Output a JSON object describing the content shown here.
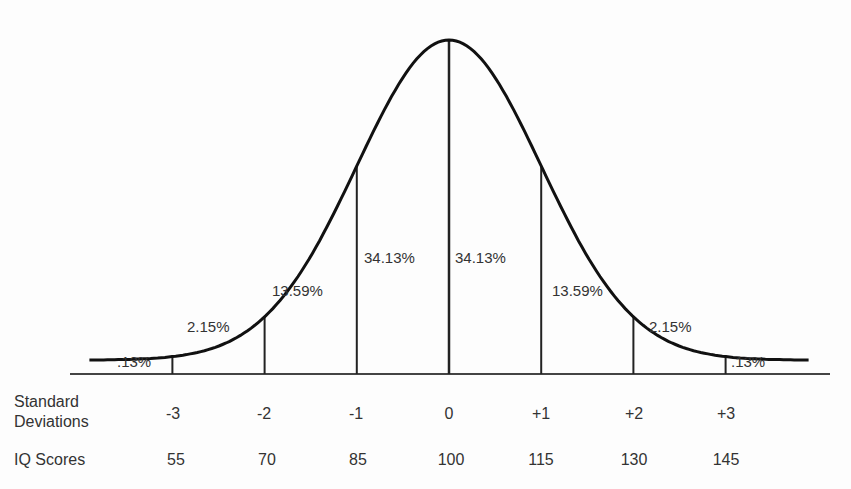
{
  "chart_data": {
    "type": "area",
    "title": "",
    "subtitle": "Normal distribution of IQ scores",
    "xlabel": "",
    "ylabel": "",
    "grid": false,
    "legend": null,
    "distribution": {
      "mean": 100,
      "sd": 15,
      "x_range_sd": [
        -3.9,
        3.9
      ]
    },
    "row_labels": {
      "sd_line1": "Standard",
      "sd_line2": "Deviations",
      "iq": "IQ Scores"
    },
    "sd_ticks": [
      "-3",
      "-2",
      "-1",
      "0",
      "+1",
      "+2",
      "+3"
    ],
    "iq_ticks": [
      "55",
      "70",
      "85",
      "100",
      "115",
      "130",
      "145"
    ],
    "sd_positions": [
      -3,
      -2,
      -1,
      0,
      1,
      2,
      3
    ],
    "segments": [
      {
        "range": "< -3 SD",
        "label": ".13%",
        "value": 0.13
      },
      {
        "range": "-3 to -2 SD",
        "label": "2.15%",
        "value": 2.15
      },
      {
        "range": "-2 to -1 SD",
        "label": "13.59%",
        "value": 13.59
      },
      {
        "range": "-1 to 0 SD",
        "label": "34.13%",
        "value": 34.13
      },
      {
        "range": "0 to +1 SD",
        "label": "34.13%",
        "value": 34.13
      },
      {
        "range": "+1 to +2 SD",
        "label": "13.59%",
        "value": 13.59
      },
      {
        "range": "+2 to +3 SD",
        "label": "2.15%",
        "value": 2.15
      },
      {
        "range": "> +3 SD",
        "label": ".13%",
        "value": 0.13
      }
    ],
    "colors": {
      "curve": "#111111",
      "lines": "#222222",
      "text": "#333333",
      "background": "#fdfdfd"
    }
  }
}
